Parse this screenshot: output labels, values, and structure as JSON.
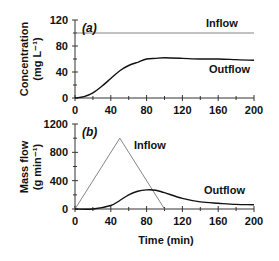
{
  "chart_data": [
    {
      "type": "line",
      "panel": "(a)",
      "title": "",
      "xlabel": "",
      "ylabel": "Concentration",
      "ylabel_units": "(mg L⁻¹)",
      "xlim": [
        0,
        200
      ],
      "ylim": [
        0,
        120
      ],
      "x_ticks": [
        0,
        40,
        80,
        120,
        160,
        200
      ],
      "y_ticks": [
        0,
        40,
        80,
        120
      ],
      "grid": false,
      "legend": "inline labels",
      "series": [
        {
          "name": "Inflow",
          "x": [
            0,
            200
          ],
          "values": [
            100,
            100
          ],
          "style": "thin gray line"
        },
        {
          "name": "Outflow",
          "x": [
            0,
            10,
            20,
            30,
            40,
            50,
            60,
            70,
            80,
            90,
            100,
            120,
            140,
            160,
            180,
            200
          ],
          "values": [
            0,
            2,
            8,
            18,
            30,
            42,
            50,
            55,
            60,
            61,
            62,
            61,
            60,
            60,
            59,
            58
          ],
          "style": "thick black line"
        }
      ]
    },
    {
      "type": "line",
      "panel": "(b)",
      "title": "",
      "xlabel": "Time (min)",
      "ylabel": "Mass flow",
      "ylabel_units": "(g min⁻¹)",
      "xlim": [
        0,
        200
      ],
      "ylim": [
        0,
        1200
      ],
      "x_ticks": [
        0,
        40,
        80,
        120,
        160,
        200
      ],
      "y_ticks": [
        0,
        400,
        800,
        1200
      ],
      "grid": false,
      "legend": "inline labels",
      "series": [
        {
          "name": "Inflow",
          "x": [
            0,
            50,
            100
          ],
          "values": [
            0,
            1000,
            0
          ],
          "style": "thin gray line"
        },
        {
          "name": "Outflow",
          "x": [
            0,
            20,
            40,
            50,
            60,
            70,
            80,
            90,
            100,
            120,
            140,
            160,
            180,
            200
          ],
          "values": [
            0,
            0,
            50,
            120,
            200,
            250,
            270,
            265,
            230,
            150,
            100,
            80,
            65,
            60
          ],
          "style": "thick black line"
        }
      ]
    }
  ],
  "labels": {
    "panel_a": "(a)",
    "panel_b": "(b)",
    "a_inflow": "Inflow",
    "a_outflow": "Outflow",
    "b_inflow": "Inflow",
    "b_outflow": "Outflow",
    "a_ylabel": "Concentration",
    "a_yunits": "(mg L⁻¹)",
    "b_ylabel": "Mass flow",
    "b_yunits": "(g min⁻¹)",
    "xlabel": "Time (min)",
    "a_yticks": [
      "0",
      "40",
      "80",
      "120"
    ],
    "b_yticks": [
      "0",
      "400",
      "800",
      "1200"
    ],
    "xticks": [
      "0",
      "40",
      "80",
      "120",
      "160",
      "200"
    ]
  },
  "colors": {
    "inflow": "#777777",
    "outflow": "#111111",
    "axis": "#333333"
  }
}
